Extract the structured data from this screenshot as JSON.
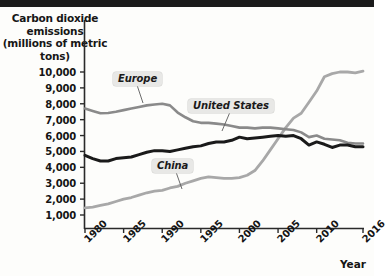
{
  "figure": {
    "y_axis_title": "Carbon dioxide emissions (millions of metric tons)",
    "x_axis_title": "Year"
  },
  "chart_data": {
    "type": "line",
    "title": "Carbon dioxide emissions (millions of metric tons)",
    "xlabel": "Year",
    "ylabel": "Carbon dioxide emissions (millions of metric tons)",
    "xlim": [
      1980,
      2016
    ],
    "ylim": [
      0,
      10500
    ],
    "grid": false,
    "legend": "inline-labels",
    "x_ticks": [
      "1980",
      "1985",
      "1990",
      "1995",
      "2000",
      "2005",
      "2010",
      "2016"
    ],
    "y_ticks": [
      "1,000",
      "2,000",
      "3,000",
      "4,000",
      "5,000",
      "6,000",
      "7,000",
      "8,000",
      "9,000",
      "10,000"
    ],
    "x": [
      1980,
      1981,
      1982,
      1983,
      1984,
      1985,
      1986,
      1987,
      1988,
      1989,
      1990,
      1991,
      1992,
      1993,
      1994,
      1995,
      1996,
      1997,
      1998,
      1999,
      2000,
      2001,
      2002,
      2003,
      2004,
      2005,
      2006,
      2007,
      2008,
      2009,
      2010,
      2011,
      2012,
      2013,
      2014,
      2015,
      2016
    ],
    "series": [
      {
        "name": "Europe",
        "color": "#8a8a8a",
        "values": [
          7700,
          7550,
          7400,
          7420,
          7500,
          7600,
          7700,
          7800,
          7900,
          7950,
          8000,
          7900,
          7450,
          7150,
          6900,
          6800,
          6800,
          6750,
          6700,
          6600,
          6500,
          6500,
          6450,
          6500,
          6500,
          6450,
          6400,
          6350,
          6200,
          5900,
          6000,
          5800,
          5750,
          5700,
          5550,
          5500,
          5500
        ]
      },
      {
        "name": "United States",
        "color": "#1a1a1a",
        "values": [
          4750,
          4550,
          4400,
          4400,
          4550,
          4600,
          4650,
          4800,
          4950,
          5050,
          5050,
          5000,
          5100,
          5200,
          5300,
          5350,
          5500,
          5600,
          5600,
          5700,
          5900,
          5800,
          5850,
          5900,
          5950,
          6000,
          5950,
          6000,
          5800,
          5400,
          5600,
          5450,
          5250,
          5400,
          5400,
          5300,
          5300
        ]
      },
      {
        "name": "China",
        "color": "#a8a8a8",
        "values": [
          1450,
          1500,
          1600,
          1700,
          1850,
          2000,
          2100,
          2250,
          2400,
          2500,
          2550,
          2700,
          2800,
          3000,
          3150,
          3300,
          3400,
          3350,
          3300,
          3300,
          3350,
          3500,
          3800,
          4400,
          5100,
          5800,
          6500,
          7100,
          7400,
          8100,
          8800,
          9700,
          9900,
          10000,
          10000,
          9950,
          10050
        ]
      }
    ]
  }
}
